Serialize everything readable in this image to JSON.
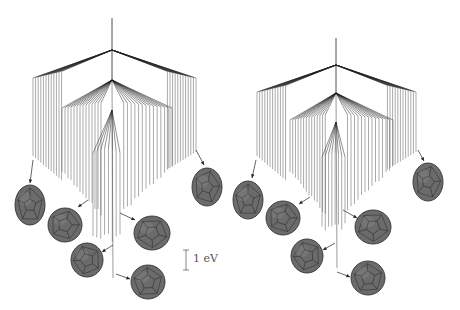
{
  "figure": {
    "panels": [
      {
        "id": "left",
        "root": {
          "x": 112,
          "top": 18,
          "node_y": 50
        },
        "level1": {
          "left_x": 33,
          "right_x": 196,
          "y": 78
        },
        "level2": {
          "left_x": 62,
          "right_x": 172,
          "apex_y": 80,
          "y": 108
        },
        "level3": {
          "left_x": 93,
          "right_x": 120,
          "apex_y": 110,
          "y": 148
        },
        "fan_left_count": 12,
        "fan_right_count": 12,
        "inner_left_count": 14,
        "inner_right_count": 14,
        "core_count": 8,
        "bottom_base": 150,
        "bottom_peak": 238,
        "cages": [
          {
            "cx": 30,
            "cy": 205,
            "rx": 15,
            "ry": 20,
            "arrow": {
              "x1": 33,
              "y1": 160,
              "x2": 30,
              "y2": 183
            }
          },
          {
            "cx": 65,
            "cy": 225,
            "rx": 17,
            "ry": 17,
            "arrow": {
              "x1": 88,
              "y1": 200,
              "x2": 78,
              "y2": 207
            }
          },
          {
            "cx": 152,
            "cy": 233,
            "rx": 18,
            "ry": 17,
            "arrow": {
              "x1": 120,
              "y1": 213,
              "x2": 135,
              "y2": 220
            }
          },
          {
            "cx": 87,
            "cy": 260,
            "rx": 16,
            "ry": 17,
            "arrow": {
              "x1": 113,
              "y1": 245,
              "x2": 102,
              "y2": 252
            }
          },
          {
            "cx": 148,
            "cy": 282,
            "rx": 17,
            "ry": 17,
            "arrow": {
              "x1": 116,
              "y1": 274,
              "x2": 130,
              "y2": 279
            }
          },
          {
            "cx": 207,
            "cy": 187,
            "rx": 15,
            "ry": 19,
            "arrow": {
              "x1": 196,
              "y1": 150,
              "x2": 204,
              "y2": 165
            }
          }
        ]
      },
      {
        "id": "right",
        "root": {
          "x": 336,
          "top": 38,
          "node_y": 65
        },
        "level1": {
          "left_x": 257,
          "right_x": 416,
          "y": 92
        },
        "level2": {
          "left_x": 290,
          "right_x": 393,
          "apex_y": 93,
          "y": 120
        },
        "level3": {
          "left_x": 322,
          "right_x": 345,
          "apex_y": 122,
          "y": 152
        },
        "fan_left_count": 12,
        "fan_right_count": 12,
        "inner_left_count": 14,
        "inner_right_count": 14,
        "core_count": 8,
        "bottom_base": 150,
        "bottom_peak": 228,
        "cages": [
          {
            "cx": 248,
            "cy": 200,
            "rx": 15,
            "ry": 19,
            "arrow": {
              "x1": 256,
              "y1": 160,
              "x2": 252,
              "y2": 178
            }
          },
          {
            "cx": 283,
            "cy": 218,
            "rx": 17,
            "ry": 17,
            "arrow": {
              "x1": 310,
              "y1": 197,
              "x2": 299,
              "y2": 204
            }
          },
          {
            "cx": 373,
            "cy": 227,
            "rx": 18,
            "ry": 17,
            "arrow": {
              "x1": 343,
              "y1": 210,
              "x2": 357,
              "y2": 218
            }
          },
          {
            "cx": 307,
            "cy": 256,
            "rx": 16,
            "ry": 17,
            "arrow": {
              "x1": 335,
              "y1": 243,
              "x2": 323,
              "y2": 250
            }
          },
          {
            "cx": 368,
            "cy": 278,
            "rx": 17,
            "ry": 17,
            "arrow": {
              "x1": 337,
              "y1": 272,
              "x2": 350,
              "y2": 277
            }
          },
          {
            "cx": 428,
            "cy": 182,
            "rx": 15,
            "ry": 19,
            "arrow": {
              "x1": 418,
              "y1": 150,
              "x2": 424,
              "y2": 161
            }
          }
        ]
      }
    ],
    "scale_bar": {
      "x": 186,
      "y1": 250,
      "y2": 270,
      "label": "1 eV"
    },
    "colors": {
      "line": "#555555",
      "dark_line": "#222222",
      "cage_fill": "#6b6b6b",
      "cage_edge": "#333333"
    }
  }
}
